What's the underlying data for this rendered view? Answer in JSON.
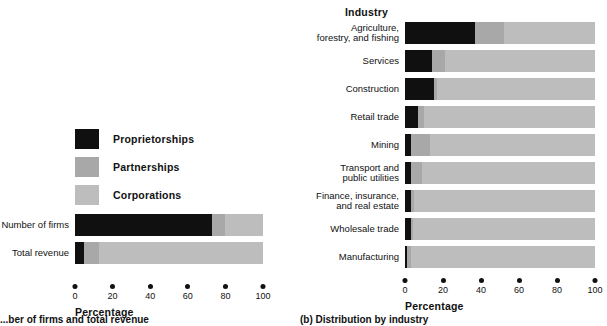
{
  "colors": {
    "proprietorships": "#101010",
    "partnerships": "#a8a8a8",
    "corporations": "#bdbdbd",
    "text": "#111111",
    "background": "#ffffff"
  },
  "legend": {
    "items": [
      {
        "label": "Proprietorships",
        "color": "#101010",
        "swatch_name": "legend-swatch-proprietorships"
      },
      {
        "label": "Partnerships",
        "color": "#a8a8a8",
        "swatch_name": "legend-swatch-partnerships"
      },
      {
        "label": "Corporations",
        "color": "#bdbdbd",
        "swatch_name": "legend-swatch-corporations"
      }
    ]
  },
  "left_panel": {
    "axis_title": "Percentage",
    "footnote": "...ber of firms and total revenue"
  },
  "right_panel": {
    "column_header": "Industry",
    "axis_title": "Percentage",
    "footnote": "(b) Distribution by industry"
  },
  "chart_data": [
    {
      "type": "bar",
      "orientation": "horizontal",
      "stacked": true,
      "title": "",
      "xlabel": "Percentage",
      "ylabel": "",
      "xlim": [
        0,
        100
      ],
      "xticks": [
        0,
        20,
        40,
        60,
        80,
        100
      ],
      "grid": false,
      "legend_position": "above-plot-left",
      "categories": [
        "Number of firms",
        "Total revenue"
      ],
      "series": [
        {
          "name": "Proprietorships",
          "color": "#101010",
          "values": [
            73,
            5
          ]
        },
        {
          "name": "Partnerships",
          "color": "#a8a8a8",
          "values": [
            7,
            8
          ]
        },
        {
          "name": "Corporations",
          "color": "#bdbdbd",
          "values": [
            20,
            87
          ]
        }
      ]
    },
    {
      "type": "bar",
      "orientation": "horizontal",
      "stacked": true,
      "title": "Industry",
      "xlabel": "Percentage",
      "ylabel": "Industry",
      "xlim": [
        0,
        100
      ],
      "xticks": [
        0,
        20,
        40,
        60,
        80,
        100
      ],
      "grid": false,
      "legend_position": "shared-with-left-panel",
      "categories": [
        "Agriculture,\nforestry, and fishing",
        "Services",
        "Construction",
        "Retail trade",
        "Mining",
        "Transport and\npublic utilities",
        "Finance, insurance,\nand real estate",
        "Wholesale trade",
        "Manufacturing"
      ],
      "series": [
        {
          "name": "Proprietorships",
          "color": "#101010",
          "values": [
            37,
            14,
            15,
            7,
            3,
            3,
            3,
            3,
            1
          ]
        },
        {
          "name": "Partnerships",
          "color": "#a8a8a8",
          "values": [
            15,
            7,
            2,
            3,
            10,
            6,
            2,
            1,
            2
          ]
        },
        {
          "name": "Corporations",
          "color": "#bdbdbd",
          "values": [
            48,
            79,
            83,
            90,
            87,
            91,
            95,
            96,
            97
          ]
        }
      ]
    }
  ]
}
